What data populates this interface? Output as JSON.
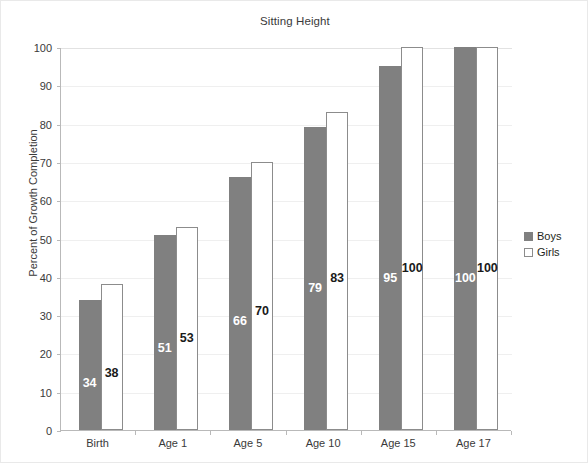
{
  "chart_data": {
    "type": "bar",
    "title": "Sitting Height",
    "xlabel": "",
    "ylabel": "Percent of Growth Completion",
    "ylim": [
      0,
      100
    ],
    "ytick_labels": [
      "0",
      "10",
      "20",
      "30",
      "40",
      "50",
      "60",
      "70",
      "80",
      "90",
      "100"
    ],
    "ytick_values": [
      0,
      10,
      20,
      30,
      40,
      50,
      60,
      70,
      80,
      90,
      100
    ],
    "grid": true,
    "legend_position": "right",
    "categories": [
      "Birth",
      "Age 1",
      "Age 5",
      "Age 10",
      "Age 15",
      "Age 17"
    ],
    "series": [
      {
        "name": "Boys",
        "color": "#808080",
        "values": [
          34,
          51,
          66,
          79,
          95,
          100
        ],
        "labels": [
          "34",
          "51",
          "66",
          "79",
          "95",
          "100"
        ]
      },
      {
        "name": "Girls",
        "color": "#ffffff",
        "values": [
          38,
          53,
          70,
          83,
          100,
          100
        ],
        "labels": [
          "38",
          "53",
          "70",
          "83",
          "100",
          "100"
        ]
      }
    ]
  },
  "legend": {
    "items": [
      {
        "label": "Boys",
        "swatch": "filled-gray-square-icon"
      },
      {
        "label": "Girls",
        "swatch": "outlined-white-square-icon"
      }
    ]
  }
}
